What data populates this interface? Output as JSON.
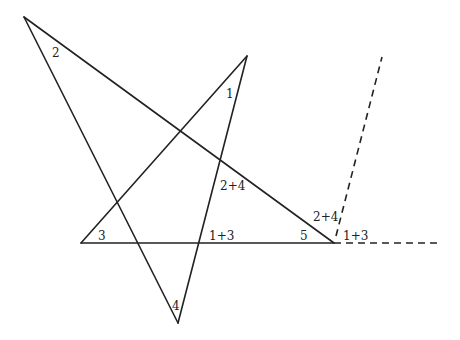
{
  "diagram": {
    "ink_color": "#222222",
    "background_color": "#ffffff",
    "vertices": {
      "top_left": "A",
      "top": "B",
      "left_base": "C",
      "bottom": "D",
      "right_base": "E"
    },
    "angle_labels": {
      "top_left": "2",
      "top": "1",
      "left_base": "3",
      "bottom": "4",
      "right_base_interior": "5",
      "right_base_exterior_upper": "2+4",
      "right_base_exterior_lower": "1+3",
      "inner_upper": "2+4",
      "inner_lower": "1+3"
    }
  }
}
